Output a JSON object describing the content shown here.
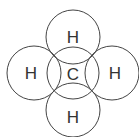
{
  "diagram": {
    "center_atom": {
      "label": "C",
      "cx": 73,
      "cy": 73
    },
    "outer_atoms": [
      {
        "label": "H",
        "position": "top",
        "cx": 73,
        "cy": 37
      },
      {
        "label": "H",
        "position": "left",
        "cx": 34,
        "cy": 73
      },
      {
        "label": "H",
        "position": "right",
        "cx": 112,
        "cy": 73
      },
      {
        "label": "H",
        "position": "bottom",
        "cx": 73,
        "cy": 110
      }
    ],
    "radius": 27,
    "stroke_color": "#444444"
  }
}
